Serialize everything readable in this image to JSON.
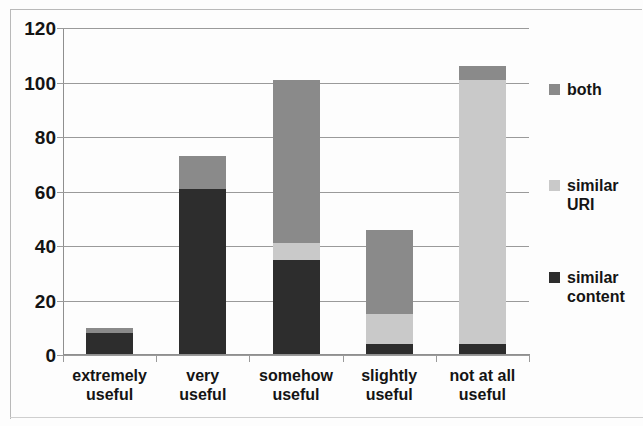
{
  "chart_data": {
    "type": "bar",
    "subtype": "stacked-vertical-bar",
    "title": "",
    "xlabel": "",
    "ylabel": "",
    "ylim": [
      0,
      120
    ],
    "ytick_step": 20,
    "yticks": [
      0,
      20,
      40,
      60,
      80,
      100,
      120
    ],
    "ytick_labels": [
      "0",
      "20",
      "40",
      "60",
      "80",
      "100",
      "120"
    ],
    "grid": true,
    "grid_axis": "y",
    "legend_position": "right",
    "categories": [
      "extremely\nuseful",
      "very\nuseful",
      "somehow\nuseful",
      "slightly\nuseful",
      "not at all\nuseful"
    ],
    "category_labels_flat": [
      "extremely useful",
      "very useful",
      "somehow useful",
      "slightly useful",
      "not at all useful"
    ],
    "series": [
      {
        "name": "similar content",
        "legend_label": "similar\ncontent",
        "color": "#2d2d2d",
        "values": [
          8,
          61,
          35,
          4,
          4
        ]
      },
      {
        "name": "similar URI",
        "legend_label": "similar\nURI",
        "color": "#c9c9c9",
        "values": [
          0,
          0,
          6,
          11,
          97
        ]
      },
      {
        "name": "both",
        "legend_label": "both",
        "color": "#8a8a8a",
        "values": [
          2,
          12,
          60,
          31,
          5
        ]
      }
    ],
    "stack_order_bottom_to_top": [
      "similar content",
      "similar URI",
      "both"
    ],
    "totals": [
      10,
      73,
      101,
      46,
      106
    ]
  },
  "legend": {
    "entries": [
      {
        "label": "both",
        "color": "#8a8a8a"
      },
      {
        "label": "similar\nURI",
        "color": "#c9c9c9"
      },
      {
        "label": "similar\ncontent",
        "color": "#2d2d2d"
      }
    ]
  },
  "axes": {
    "y_labels": [
      "120",
      "100",
      "80",
      "60",
      "40",
      "20",
      "0"
    ],
    "x_labels": [
      "extremely\nuseful",
      "very\nuseful",
      "somehow\nuseful",
      "slightly\nuseful",
      "not at all\nuseful"
    ]
  }
}
